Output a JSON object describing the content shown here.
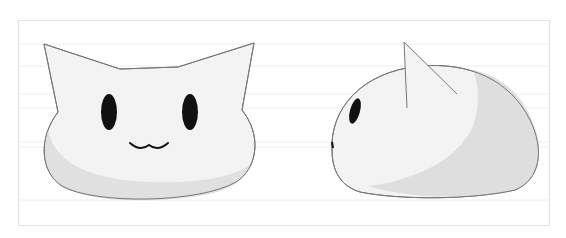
{
  "illustration": {
    "subject": "white cat-shaped blob character",
    "views": [
      {
        "name": "front view",
        "features": [
          "two pointed ears",
          "two oval black eyes",
          "w-shaped mouth"
        ]
      },
      {
        "name": "side view",
        "features": [
          "single ear",
          "one eye",
          "dome-shaped body"
        ]
      }
    ],
    "colors": {
      "background": "#ffffff",
      "frame_border": "#e2e2e2",
      "guide_lines": "#eeeeee",
      "body_light": "#f3f3f3",
      "body_shadow": "#dedede",
      "outline": "#777777",
      "eyes": "#111111"
    }
  }
}
